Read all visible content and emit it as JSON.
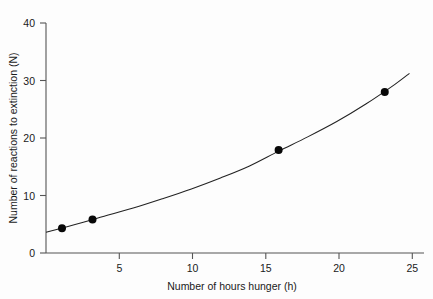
{
  "chart_data": {
    "type": "scatter",
    "title": "",
    "subtitle": "",
    "xlabel": "Number of hours hunger (h)",
    "ylabel": "Number of reactions to extinction (N)",
    "xlim": [
      0,
      26
    ],
    "ylim": [
      0,
      42
    ],
    "xticks": [
      5,
      10,
      15,
      20,
      25
    ],
    "yticks": [
      0,
      10,
      20,
      30,
      40
    ],
    "xtick_labels": [
      "5",
      "10",
      "15",
      "20",
      "25"
    ],
    "ytick_labels": [
      "0",
      "10",
      "20",
      "30",
      "40"
    ],
    "grid": false,
    "legend": false,
    "legend_position": "none",
    "marker_color": "#080808",
    "curve_color": "#222222",
    "axis_color": "#555555",
    "background_color": "#fdfdfd",
    "points": [
      {
        "x": 1.1,
        "y": 4.5
      },
      {
        "x": 3.2,
        "y": 6.1
      },
      {
        "x": 16.0,
        "y": 18.8
      },
      {
        "x": 23.3,
        "y": 29.4
      }
    ],
    "series": [
      {
        "name": "observed reactions",
        "x": [
          1.1,
          3.2,
          16.0,
          23.3
        ],
        "values": [
          4.5,
          6.1,
          18.8,
          29.4
        ]
      },
      {
        "name": "fitted curve",
        "x": [
          0,
          2,
          4,
          6,
          8,
          10,
          12,
          14,
          16,
          18,
          20,
          22,
          24,
          25
        ],
        "values": [
          3.8,
          5.2,
          6.7,
          8.2,
          9.9,
          11.7,
          13.7,
          15.9,
          18.6,
          21.2,
          24.0,
          27.2,
          30.8,
          32.8
        ]
      }
    ],
    "annotations": []
  },
  "figure": {
    "caption": ""
  }
}
